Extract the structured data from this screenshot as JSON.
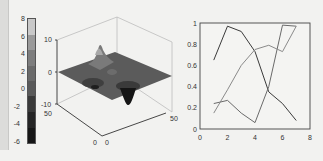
{
  "colorbar": {
    "ticks": [
      "8",
      "6",
      "4",
      "2",
      "0",
      "-2",
      "-4",
      "-6"
    ],
    "colors": [
      "#c8c8c8",
      "#9a9a9a",
      "#7d7d7d",
      "#6a6a6a",
      "#5a5a5a",
      "#3a3a3a",
      "#252525",
      "#161616"
    ]
  },
  "surface_plot": {
    "z_ticks": [
      "10",
      "0",
      "-10"
    ],
    "y_ticks": [
      "50",
      "0"
    ],
    "x_ticks": [
      "0",
      "50"
    ]
  },
  "chart_data": [
    {
      "type": "surface",
      "title": "",
      "zlim": [
        -10,
        10
      ],
      "xlim": [
        0,
        50
      ],
      "ylim": [
        0,
        50
      ],
      "z_ticks": [
        10,
        0,
        -10
      ],
      "x_ticks": [
        0,
        50
      ],
      "y_ticks": [
        0,
        50
      ],
      "colorbar": {
        "range": [
          -6,
          8
        ],
        "ticks": [
          8,
          6,
          4,
          2,
          0,
          -2,
          -4,
          -6
        ]
      },
      "features": "peaks-like surface: one tall peak (~8), two depressions, deepest trough (~-6)"
    },
    {
      "type": "line",
      "title": "",
      "xlabel": "",
      "ylabel": "",
      "xlim": [
        0,
        8
      ],
      "ylim": [
        0,
        1
      ],
      "x_ticks": [
        "0",
        "2",
        "4",
        "6",
        "8"
      ],
      "y_ticks": [
        "0",
        "0.2",
        "0.4",
        "0.6",
        "0.8",
        "1"
      ],
      "grid": false,
      "legend": null,
      "x": [
        1,
        2,
        3,
        4,
        5,
        6,
        7
      ],
      "series": [
        {
          "name": "series1",
          "color": "#3a3a3a",
          "values": [
            0.65,
            0.97,
            0.92,
            0.73,
            0.35,
            0.24,
            0.08
          ]
        },
        {
          "name": "series2",
          "color": "#6a6a6a",
          "values": [
            0.24,
            0.27,
            0.15,
            0.06,
            0.4,
            0.98,
            0.97
          ]
        },
        {
          "name": "series3",
          "color": "#8a8a8a",
          "values": [
            0.15,
            0.37,
            0.6,
            0.75,
            0.79,
            0.73,
            0.97
          ]
        }
      ]
    }
  ]
}
